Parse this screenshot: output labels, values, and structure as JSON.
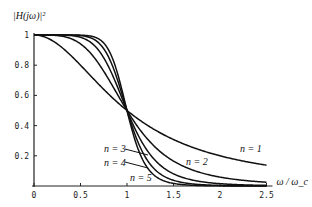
{
  "chart_data": {
    "type": "line",
    "title": "",
    "ylabel": "|H(jω)|²",
    "xlabel": "ω / ω_c",
    "xlim": [
      0,
      2.5
    ],
    "ylim": [
      0,
      1
    ],
    "xticks": [
      "0",
      "0.5",
      "1",
      "1.5",
      "2",
      "2.5"
    ],
    "yticks": [
      "0.2",
      "0.4",
      "0.6",
      "0.8",
      "1"
    ],
    "grid": false,
    "formula": "1/(1+x^(2n))",
    "x": [
      0,
      0.25,
      0.5,
      0.75,
      1.0,
      1.25,
      1.5,
      1.75,
      2.0,
      2.25,
      2.5
    ],
    "series": [
      {
        "name": "n = 1",
        "n": 1,
        "values": [
          1.0,
          0.941,
          0.8,
          0.64,
          0.5,
          0.39,
          0.308,
          0.246,
          0.2,
          0.165,
          0.138
        ]
      },
      {
        "name": "n = 2",
        "n": 2,
        "values": [
          1.0,
          0.996,
          0.941,
          0.76,
          0.5,
          0.291,
          0.165,
          0.096,
          0.059,
          0.038,
          0.025
        ]
      },
      {
        "name": "n = 3",
        "n": 3,
        "values": [
          1.0,
          1.0,
          0.985,
          0.849,
          0.5,
          0.208,
          0.081,
          0.035,
          0.015,
          0.008,
          0.004
        ]
      },
      {
        "name": "n = 4",
        "n": 4,
        "values": [
          1.0,
          1.0,
          0.996,
          0.909,
          0.5,
          0.144,
          0.038,
          0.011,
          0.004,
          0.001,
          0.001
        ]
      },
      {
        "name": "n = 5",
        "n": 5,
        "values": [
          1.0,
          1.0,
          0.999,
          0.947,
          0.5,
          0.097,
          0.017,
          0.004,
          0.001,
          0.0,
          0.0
        ]
      }
    ],
    "annotations": [
      "n = 1",
      "n = 2",
      "n = 3",
      "n = 4",
      "n = 5"
    ]
  }
}
